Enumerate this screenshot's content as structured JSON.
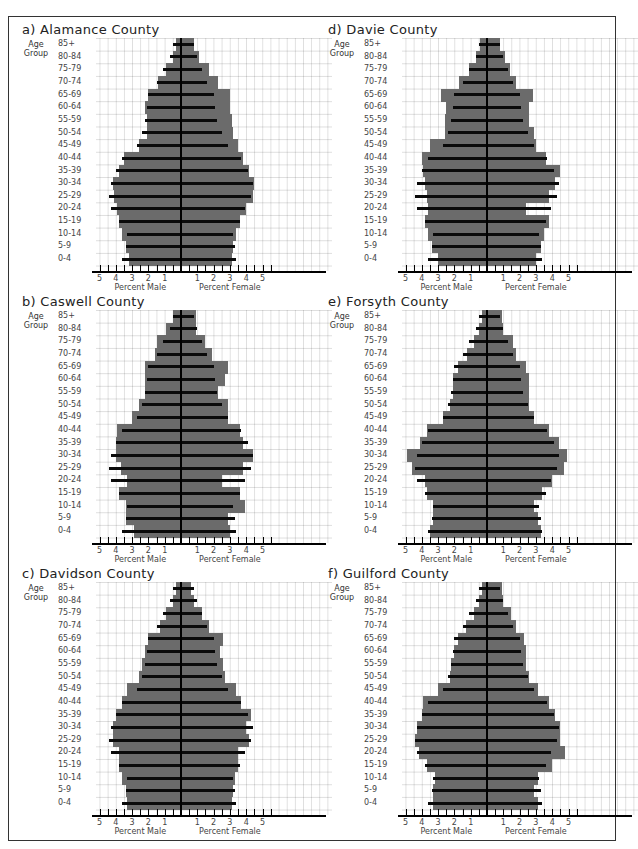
{
  "chart_data": [
    {
      "type": "bar",
      "subtype": "population-pyramid",
      "title": "a) Alamance County",
      "categories": [
        "85+",
        "80-84",
        "75-79",
        "70-74",
        "65-69",
        "60-64",
        "55-59",
        "50-54",
        "45-49",
        "40-44",
        "35-39",
        "30-34",
        "25-29",
        "20-24",
        "15-19",
        "10-14",
        "5-9",
        "0-4"
      ],
      "series": [
        {
          "name": "County Male (gray)",
          "values": [
            0.3,
            0.5,
            0.9,
            1.4,
            2.0,
            2.2,
            2.1,
            2.1,
            2.6,
            3.5,
            3.8,
            4.2,
            4.1,
            3.9,
            3.8,
            3.6,
            3.4,
            3.2
          ]
        },
        {
          "name": "County Female (gray)",
          "values": [
            0.8,
            1.1,
            1.7,
            2.3,
            3.0,
            3.0,
            3.1,
            3.2,
            3.5,
            3.8,
            4.2,
            4.5,
            4.4,
            4.0,
            3.6,
            3.4,
            3.2,
            3.1
          ]
        },
        {
          "name": "Reference Male (black)",
          "values": [
            0.5,
            0.7,
            1.1,
            1.5,
            2.0,
            2.1,
            2.2,
            2.4,
            2.7,
            3.6,
            4.0,
            4.3,
            4.4,
            4.3,
            3.8,
            3.3,
            3.4,
            3.6
          ]
        },
        {
          "name": "Reference Female (black)",
          "values": [
            0.8,
            1.0,
            1.3,
            1.6,
            2.0,
            2.1,
            2.2,
            2.5,
            2.9,
            3.7,
            4.1,
            4.4,
            4.3,
            3.9,
            3.6,
            3.2,
            3.3,
            3.4
          ]
        }
      ],
      "xlabel_left": "Percent Male",
      "xlabel_right": "Percent Female",
      "ylabel": "Age Group",
      "xlim": [
        -5,
        5
      ]
    },
    {
      "type": "bar",
      "subtype": "population-pyramid",
      "title": "b) Caswell County",
      "categories": [
        "85+",
        "80-84",
        "75-79",
        "70-74",
        "65-69",
        "60-64",
        "55-59",
        "50-54",
        "45-49",
        "40-44",
        "35-39",
        "30-34",
        "25-29",
        "20-24",
        "15-19",
        "10-14",
        "5-9",
        "0-4"
      ],
      "series": [
        {
          "name": "County Male (gray)",
          "values": [
            0.5,
            0.9,
            1.5,
            1.6,
            2.2,
            2.2,
            2.2,
            2.6,
            3.0,
            3.9,
            4.0,
            4.0,
            3.7,
            3.3,
            3.8,
            3.4,
            3.4,
            2.9
          ]
        },
        {
          "name": "County Female (gray)",
          "values": [
            0.9,
            0.9,
            1.5,
            1.9,
            2.9,
            2.7,
            2.3,
            2.9,
            2.9,
            3.6,
            3.8,
            4.4,
            3.8,
            2.5,
            3.6,
            3.9,
            2.9,
            3.0
          ]
        },
        {
          "name": "Reference Male (black)",
          "values": [
            0.5,
            0.7,
            1.1,
            1.5,
            2.0,
            2.1,
            2.2,
            2.4,
            2.7,
            3.6,
            4.0,
            4.3,
            4.4,
            4.3,
            3.8,
            3.3,
            3.4,
            3.6
          ]
        },
        {
          "name": "Reference Female (black)",
          "values": [
            0.8,
            1.0,
            1.3,
            1.6,
            2.0,
            2.1,
            2.2,
            2.5,
            2.9,
            3.7,
            4.1,
            4.4,
            4.3,
            3.9,
            3.6,
            3.2,
            3.3,
            3.4
          ]
        }
      ],
      "xlabel_left": "Percent Male",
      "xlabel_right": "Percent Female",
      "ylabel": "Age Group",
      "xlim": [
        -5,
        5
      ]
    },
    {
      "type": "bar",
      "subtype": "population-pyramid",
      "title": "c) Davidson County",
      "categories": [
        "85+",
        "80-84",
        "75-79",
        "70-74",
        "65-69",
        "60-64",
        "55-59",
        "50-54",
        "45-49",
        "40-44",
        "35-39",
        "30-34",
        "25-29",
        "20-24",
        "15-19",
        "10-14",
        "5-9",
        "0-4"
      ],
      "series": [
        {
          "name": "County Male (gray)",
          "values": [
            0.3,
            0.5,
            0.9,
            1.3,
            2.0,
            2.2,
            2.4,
            2.6,
            3.3,
            3.6,
            4.0,
            4.2,
            4.2,
            3.8,
            3.8,
            3.6,
            3.4,
            3.3
          ]
        },
        {
          "name": "County Female (gray)",
          "values": [
            0.6,
            0.8,
            1.3,
            1.7,
            2.6,
            2.4,
            2.6,
            2.7,
            3.4,
            3.7,
            4.3,
            4.0,
            4.2,
            3.5,
            3.5,
            3.3,
            3.2,
            3.1
          ]
        },
        {
          "name": "Reference Male (black)",
          "values": [
            0.5,
            0.7,
            1.1,
            1.5,
            2.0,
            2.1,
            2.2,
            2.4,
            2.7,
            3.6,
            4.0,
            4.3,
            4.4,
            4.3,
            3.8,
            3.3,
            3.4,
            3.6
          ]
        },
        {
          "name": "Reference Female (black)",
          "values": [
            0.8,
            1.0,
            1.3,
            1.6,
            2.0,
            2.1,
            2.2,
            2.5,
            2.9,
            3.7,
            4.1,
            4.4,
            4.3,
            3.9,
            3.6,
            3.2,
            3.3,
            3.4
          ]
        }
      ],
      "xlabel_left": "Percent Male",
      "xlabel_right": "Percent Female",
      "ylabel": "Age Group",
      "xlim": [
        -5,
        5
      ]
    },
    {
      "type": "bar",
      "subtype": "population-pyramid",
      "title": "d) Davie County",
      "categories": [
        "85+",
        "80-84",
        "75-79",
        "70-74",
        "65-69",
        "60-64",
        "55-59",
        "50-54",
        "45-49",
        "40-44",
        "35-39",
        "30-34",
        "25-29",
        "20-24",
        "15-19",
        "10-14",
        "5-9",
        "0-4"
      ],
      "series": [
        {
          "name": "County Male (gray)",
          "values": [
            0.4,
            0.7,
            1.1,
            1.7,
            2.8,
            2.5,
            2.6,
            2.6,
            3.5,
            4.0,
            3.9,
            3.8,
            3.7,
            3.6,
            3.8,
            3.6,
            3.4,
            3.0
          ]
        },
        {
          "name": "County Female (gray)",
          "values": [
            0.8,
            1.1,
            1.4,
            1.8,
            2.8,
            2.6,
            2.6,
            2.9,
            3.0,
            3.6,
            4.5,
            4.2,
            3.8,
            2.4,
            3.8,
            3.5,
            3.3,
            3.0
          ]
        },
        {
          "name": "Reference Male (black)",
          "values": [
            0.5,
            0.7,
            1.1,
            1.5,
            2.0,
            2.1,
            2.2,
            2.4,
            2.7,
            3.6,
            4.0,
            4.3,
            4.4,
            4.3,
            3.8,
            3.3,
            3.4,
            3.6
          ]
        },
        {
          "name": "Reference Female (black)",
          "values": [
            0.8,
            1.0,
            1.3,
            1.6,
            2.0,
            2.1,
            2.2,
            2.5,
            2.9,
            3.7,
            4.1,
            4.4,
            4.3,
            3.9,
            3.6,
            3.2,
            3.3,
            3.4
          ]
        }
      ],
      "xlabel_left": "Percent Male",
      "xlabel_right": "Percent Female",
      "ylabel": "Age Group",
      "xlim": [
        -5,
        5
      ]
    },
    {
      "type": "bar",
      "subtype": "population-pyramid",
      "title": "e) Forsyth County",
      "categories": [
        "85+",
        "80-84",
        "75-79",
        "70-74",
        "65-69",
        "60-64",
        "55-59",
        "50-54",
        "45-49",
        "40-44",
        "35-39",
        "30-34",
        "25-29",
        "20-24",
        "15-19",
        "10-14",
        "5-9",
        "0-4"
      ],
      "series": [
        {
          "name": "County Male (gray)",
          "values": [
            0.3,
            0.5,
            0.8,
            1.2,
            1.8,
            2.1,
            2.1,
            2.3,
            2.7,
            3.7,
            4.1,
            4.9,
            4.6,
            3.8,
            3.7,
            3.3,
            3.3,
            3.5
          ]
        },
        {
          "name": "County Female (gray)",
          "values": [
            0.9,
            1.0,
            1.6,
            1.8,
            2.4,
            2.6,
            2.6,
            2.6,
            2.9,
            3.8,
            4.4,
            4.9,
            4.7,
            4.0,
            3.4,
            2.9,
            3.1,
            3.3
          ]
        },
        {
          "name": "Reference Male (black)",
          "values": [
            0.5,
            0.7,
            1.1,
            1.5,
            2.0,
            2.1,
            2.2,
            2.4,
            2.7,
            3.6,
            4.0,
            4.3,
            4.4,
            4.3,
            3.8,
            3.3,
            3.4,
            3.6
          ]
        },
        {
          "name": "Reference Female (black)",
          "values": [
            0.8,
            1.0,
            1.3,
            1.6,
            2.0,
            2.1,
            2.2,
            2.5,
            2.9,
            3.7,
            4.1,
            4.4,
            4.3,
            3.9,
            3.6,
            3.2,
            3.3,
            3.4
          ]
        }
      ],
      "xlabel_left": "Percent Male",
      "xlabel_right": "Percent Female",
      "ylabel": "Age Group",
      "xlim": [
        -5,
        5
      ]
    },
    {
      "type": "bar",
      "subtype": "population-pyramid",
      "title": "f) Guilford County",
      "categories": [
        "85+",
        "80-84",
        "75-79",
        "70-74",
        "65-69",
        "60-64",
        "55-59",
        "50-54",
        "45-49",
        "40-44",
        "35-39",
        "30-34",
        "25-29",
        "20-24",
        "15-19",
        "10-14",
        "5-9",
        "0-4"
      ],
      "series": [
        {
          "name": "County Male (gray)",
          "values": [
            0.3,
            0.5,
            0.8,
            1.3,
            1.8,
            2.0,
            2.2,
            2.3,
            3.0,
            3.9,
            4.0,
            4.3,
            4.4,
            4.2,
            3.7,
            3.2,
            3.3,
            3.3
          ]
        },
        {
          "name": "County Female (gray)",
          "values": [
            0.9,
            1.0,
            1.5,
            1.8,
            2.3,
            2.4,
            2.4,
            2.6,
            3.1,
            3.8,
            4.2,
            4.5,
            4.5,
            4.8,
            4.0,
            3.1,
            2.9,
            3.1
          ]
        },
        {
          "name": "Reference Male (black)",
          "values": [
            0.5,
            0.7,
            1.1,
            1.5,
            2.0,
            2.1,
            2.2,
            2.4,
            2.7,
            3.6,
            4.0,
            4.3,
            4.4,
            4.3,
            3.8,
            3.3,
            3.4,
            3.6
          ]
        },
        {
          "name": "Reference Female (black)",
          "values": [
            0.8,
            1.0,
            1.3,
            1.6,
            2.0,
            2.1,
            2.2,
            2.5,
            2.9,
            3.7,
            4.1,
            4.4,
            4.3,
            3.9,
            3.6,
            3.2,
            3.3,
            3.4
          ]
        }
      ],
      "xlabel_left": "Percent Male",
      "xlabel_right": "Percent Female",
      "ylabel": "Age Group",
      "xlim": [
        -5,
        5
      ]
    }
  ],
  "labels": {
    "age_group": "Age Group",
    "percent_male": "Percent Male",
    "percent_female": "Percent Female",
    "tick_labels": [
      "5",
      "4",
      "3",
      "2",
      "1",
      "1",
      "2",
      "3",
      "4",
      "5"
    ]
  },
  "colors": {
    "county_bar": "#6b6b6b",
    "reference_bar": "#0a0a0a",
    "grid": "#d0d0d0"
  }
}
